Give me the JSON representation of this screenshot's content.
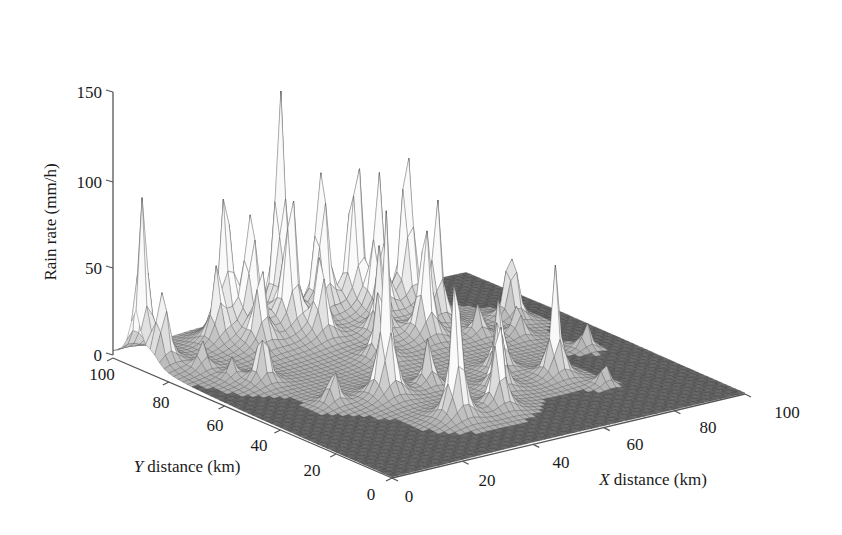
{
  "chart_data": {
    "type": "surface3d",
    "title": "",
    "xlabel": "X distance (km)",
    "ylabel": "Y distance (km)",
    "zlabel": "Rain rate (mm/h)",
    "xlim": [
      0,
      100
    ],
    "ylim": [
      0,
      100
    ],
    "zlim": [
      0,
      150
    ],
    "x_ticks": [
      "0",
      "20",
      "40",
      "60",
      "80",
      "100"
    ],
    "y_ticks": [
      "0",
      "20",
      "40",
      "60",
      "80",
      "100"
    ],
    "z_ticks": [
      "0",
      "50",
      "100",
      "150"
    ],
    "grid": false,
    "legend": null,
    "render_style": "wireframe mesh, grayscale",
    "peaks": [
      {
        "x": 2,
        "y": 92,
        "z": 105
      },
      {
        "x": 3,
        "y": 86,
        "z": 50
      },
      {
        "x": 8,
        "y": 78,
        "z": 18
      },
      {
        "x": 10,
        "y": 70,
        "z": 12
      },
      {
        "x": 14,
        "y": 64,
        "z": 40
      },
      {
        "x": 20,
        "y": 88,
        "z": 40
      },
      {
        "x": 24,
        "y": 90,
        "z": 95
      },
      {
        "x": 28,
        "y": 86,
        "z": 85
      },
      {
        "x": 26,
        "y": 80,
        "z": 50
      },
      {
        "x": 30,
        "y": 40,
        "z": 108
      },
      {
        "x": 34,
        "y": 20,
        "z": 100
      },
      {
        "x": 36,
        "y": 82,
        "z": 95
      },
      {
        "x": 38,
        "y": 88,
        "z": 150
      },
      {
        "x": 40,
        "y": 76,
        "z": 55
      },
      {
        "x": 44,
        "y": 60,
        "z": 50
      },
      {
        "x": 46,
        "y": 20,
        "z": 60
      },
      {
        "x": 48,
        "y": 86,
        "z": 110
      },
      {
        "x": 52,
        "y": 70,
        "z": 55
      },
      {
        "x": 54,
        "y": 30,
        "z": 50
      },
      {
        "x": 56,
        "y": 84,
        "z": 125
      },
      {
        "x": 58,
        "y": 78,
        "z": 90
      },
      {
        "x": 60,
        "y": 64,
        "z": 80
      },
      {
        "x": 62,
        "y": 40,
        "z": 45
      },
      {
        "x": 66,
        "y": 78,
        "z": 120
      },
      {
        "x": 68,
        "y": 70,
        "z": 75
      },
      {
        "x": 70,
        "y": 30,
        "z": 65
      },
      {
        "x": 72,
        "y": 60,
        "z": 20
      },
      {
        "x": 80,
        "y": 56,
        "z": 22
      },
      {
        "x": 86,
        "y": 66,
        "z": 55
      },
      {
        "x": 88,
        "y": 42,
        "z": 18
      },
      {
        "x": 18,
        "y": 44,
        "z": 25
      },
      {
        "x": 42,
        "y": 40,
        "z": 30
      },
      {
        "x": 76,
        "y": 20,
        "z": 15
      }
    ],
    "background_level": 0
  }
}
